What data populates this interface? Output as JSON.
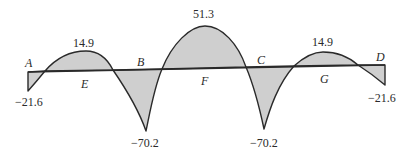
{
  "diagram": {
    "type": "bending-moment-diagram",
    "fill_color": "#cfcfcf",
    "stroke_color": "#2a2a2a",
    "points": {
      "A": "A",
      "B": "B",
      "C": "C",
      "D": "D",
      "E": "E",
      "F": "F",
      "G": "G"
    },
    "values": {
      "left_support": "−21.6",
      "span1_max": "14.9",
      "support_B": "−70.2",
      "span2_max": "51.3",
      "support_C": "−70.2",
      "span3_max": "14.9",
      "right_support": "−21.6"
    }
  }
}
